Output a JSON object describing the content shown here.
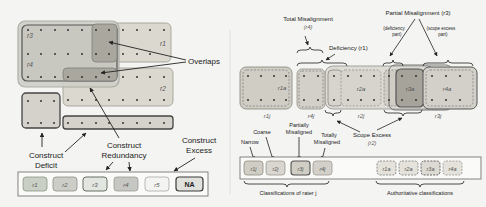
{
  "left_panel": {
    "regions": [
      {
        "id": "r3",
        "label": "r3"
      },
      {
        "id": "r4",
        "label": "r4"
      },
      {
        "id": "r1",
        "label": "r1"
      },
      {
        "id": "r2",
        "label": "r2"
      }
    ],
    "annotations": {
      "overlaps": "Overlaps",
      "construct_deficit_line1": "Construct",
      "construct_deficit_line2": "Deficit",
      "construct_redundancy_line1": "Construct",
      "construct_redundancy_line2": "Redundancy",
      "construct_excess_line1": "Construct",
      "construct_excess_line2": "Excess"
    },
    "legend": [
      {
        "label": "r1",
        "fill": "#c9cfc4",
        "stroke": "#8a9686"
      },
      {
        "label": "r2",
        "fill": "#cdcdc8",
        "stroke": "#8e8e88"
      },
      {
        "label": "r3",
        "fill": "#e3e5e0",
        "stroke": "#5a6258"
      },
      {
        "label": "r4",
        "fill": "#c6c6c2",
        "stroke": "#9a9a94"
      },
      {
        "label": "r5",
        "fill": "#f4f4f2",
        "stroke": "#a8a8a4"
      },
      {
        "label": "NA",
        "fill": "#e0e0dc",
        "stroke": "#3a3a3a"
      }
    ]
  },
  "right_panel": {
    "annotations": {
      "total_misalignment": "Total Misalignment",
      "total_misalignment_sub": "(r4)",
      "deficiency": "Deficiency (r1)",
      "partial_misalignment": "Partial Misalignment (r3)",
      "deficiency_part_line1": "(deficiency",
      "deficiency_part_line2": "part)",
      "scope_excess_part_line1": "(scope excess",
      "scope_excess_part_line2": "part)",
      "scope_excess": "Scope Excess",
      "scope_excess_sub": "(r2)",
      "narrow": "Narrow",
      "coarse": "Coarse",
      "partially_misaligned_line1": "Partially",
      "partially_misaligned_line2": "Misaligned",
      "totally_misaligned_line1": "Totally",
      "totally_misaligned_line2": "Misaligned"
    },
    "authoritative_labels": [
      "r1a",
      "r2a",
      "r3a",
      "r4a"
    ],
    "rater_labels": [
      "r1j",
      "r4j",
      "r2j",
      "r3j"
    ],
    "rater_legend": [
      {
        "label": "r1j"
      },
      {
        "label": "r2j"
      },
      {
        "label": "r3j"
      },
      {
        "label": "r4j"
      }
    ],
    "authoritative_legend": [
      {
        "label": "r1a"
      },
      {
        "label": "r2a"
      },
      {
        "label": "r3a"
      },
      {
        "label": "r4a"
      }
    ],
    "rater_group_caption": "Classifications of rater j",
    "authoritative_group_caption": "Authoritative classifications"
  }
}
